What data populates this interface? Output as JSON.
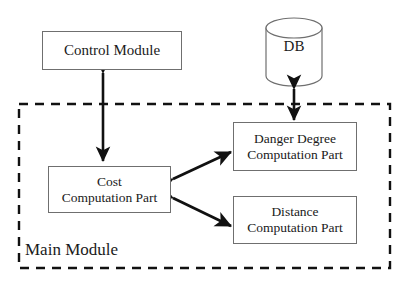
{
  "diagram": {
    "background_color": "#ffffff",
    "stroke_color": "#6f6f6f",
    "arrow_color": "#111111",
    "text_color": "#1a1a1a"
  },
  "nodes": {
    "control_module": {
      "label": "Control Module",
      "shape": "rectangle"
    },
    "db": {
      "label": "DB",
      "shape": "cylinder"
    },
    "cost_part": {
      "line1": "Cost",
      "line2": "Computation Part",
      "shape": "rectangle"
    },
    "danger_part": {
      "line1": "Danger Degree",
      "line2": "Computation Part",
      "shape": "rectangle"
    },
    "distance_part": {
      "line1": "Distance",
      "line2": "Computation Part",
      "shape": "rectangle"
    }
  },
  "container": {
    "label": "Main Module",
    "border_style": "dashed"
  },
  "connectors": [
    {
      "name": "control-to-cost",
      "from": "control_module",
      "to": "cost_part",
      "arrowheads": "both",
      "orientation": "vertical"
    },
    {
      "name": "db-to-danger",
      "from": "db",
      "to": "danger_part",
      "arrowheads": "both",
      "orientation": "vertical"
    },
    {
      "name": "cost-to-danger",
      "from": "cost_part",
      "to": "danger_part",
      "arrowheads": "both",
      "orientation": "diagonal-up-right"
    },
    {
      "name": "cost-to-distance",
      "from": "cost_part",
      "to": "distance_part",
      "arrowheads": "both",
      "orientation": "diagonal-down-right"
    }
  ]
}
